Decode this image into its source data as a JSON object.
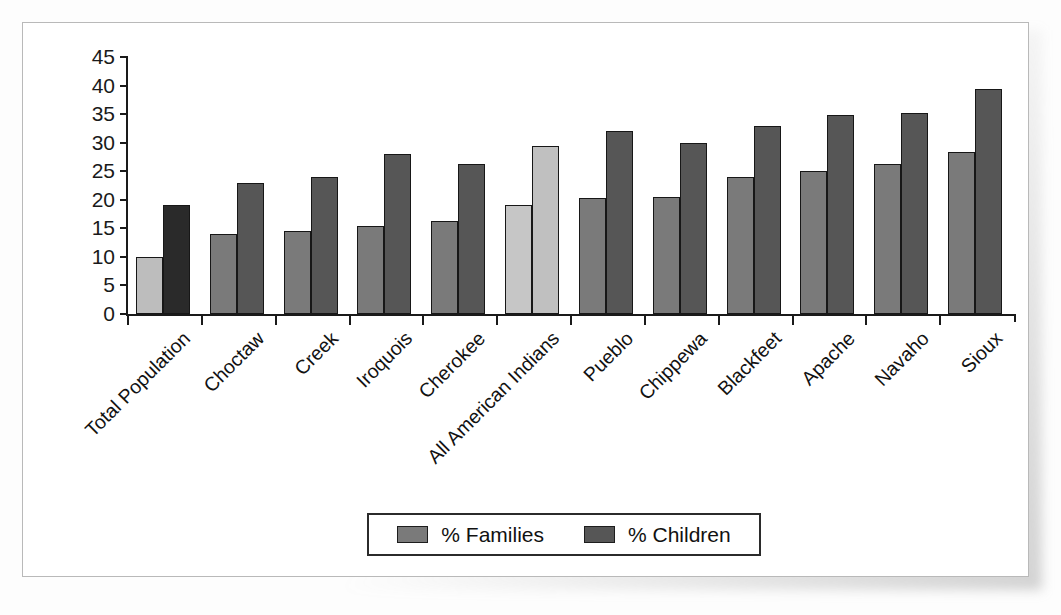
{
  "figure": {
    "frame_border_color": "#b9b9b9",
    "background_color": "#ffffff"
  },
  "legend": {
    "position": "bottom-center",
    "entries": [
      {
        "label": "% Families",
        "color": "#7a7a7a"
      },
      {
        "label": "% Children",
        "color": "#565656"
      }
    ]
  },
  "chart_data": {
    "type": "bar",
    "title": "",
    "subtitle": "",
    "xlabel": "",
    "ylabel": "",
    "ylim": [
      0,
      45
    ],
    "yticks": [
      0,
      5,
      10,
      15,
      20,
      25,
      30,
      35,
      40,
      45
    ],
    "ytick_labels": [
      "0",
      "5",
      "10",
      "15",
      "20",
      "25",
      "30",
      "35",
      "40",
      "45"
    ],
    "grid": false,
    "orientation": "vertical",
    "grouping": "grouped",
    "xtick_label_rotation": -45,
    "categories": [
      "Total Population",
      "Choctaw",
      "Creek",
      "Iroquois",
      "Cherokee",
      "All American Indians",
      "Pueblo",
      "Chippewa",
      "Blackfeet",
      "Apache",
      "Navaho",
      "Sioux"
    ],
    "series": [
      {
        "name": "% Families",
        "values": [
          10.0,
          14.0,
          14.6,
          15.4,
          16.3,
          19.0,
          20.3,
          20.4,
          24.0,
          25.1,
          26.3,
          28.3
        ],
        "colors": [
          "#bdbdbd",
          "#7a7a7a",
          "#7a7a7a",
          "#7a7a7a",
          "#7a7a7a",
          "#c6c6c6",
          "#7a7a7a",
          "#7a7a7a",
          "#7a7a7a",
          "#7a7a7a",
          "#7a7a7a",
          "#7a7a7a"
        ]
      },
      {
        "name": "% Children",
        "values": [
          19.0,
          23.0,
          24.0,
          28.0,
          26.3,
          29.5,
          32.0,
          29.9,
          33.0,
          34.9,
          35.2,
          39.4
        ],
        "colors": [
          "#2a2a2a",
          "#565656",
          "#565656",
          "#565656",
          "#565656",
          "#c0c0c0",
          "#565656",
          "#565656",
          "#565656",
          "#565656",
          "#565656",
          "#565656"
        ]
      }
    ]
  }
}
